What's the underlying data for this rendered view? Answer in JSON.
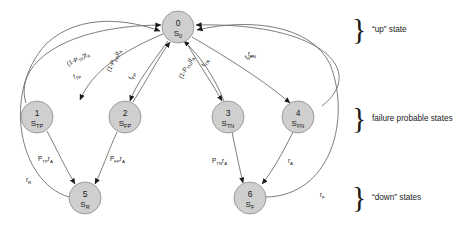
{
  "diagram": {
    "colors": {
      "node_fill": "#cfcfcf",
      "node_stroke": "#8a8a8a",
      "edge": "#6e6e6e",
      "arrow": "#1a1a1a",
      "text": "#1a1a1a",
      "background": "#ffffff"
    },
    "nodes": [
      {
        "id": "0",
        "number": "0",
        "symbol": "S",
        "subscript": "0",
        "x": 178,
        "y": 27,
        "r": 16
      },
      {
        "id": "1",
        "number": "1",
        "symbol": "S",
        "subscript": "TP",
        "x": 37,
        "y": 117,
        "r": 16
      },
      {
        "id": "2",
        "number": "2",
        "symbol": "S",
        "subscript": "FP",
        "x": 125,
        "y": 117,
        "r": 16
      },
      {
        "id": "3",
        "number": "3",
        "symbol": "S",
        "subscript": "TN",
        "x": 228,
        "y": 117,
        "r": 16
      },
      {
        "id": "4",
        "number": "4",
        "symbol": "S",
        "subscript": "FN",
        "x": 298,
        "y": 117,
        "r": 16
      },
      {
        "id": "5",
        "number": "5",
        "symbol": "S",
        "subscript": "R",
        "x": 85,
        "y": 198,
        "r": 16
      },
      {
        "id": "6",
        "number": "6",
        "symbol": "S",
        "subscript": "F",
        "x": 250,
        "y": 198,
        "r": 16
      }
    ],
    "edge_labels": [
      {
        "id": "e0_1_fwd",
        "base": "(1-P",
        "sub1": "TP",
        "mid": ")f",
        "sub2": "A",
        "x": 68,
        "y": 66,
        "rotate": -26
      },
      {
        "id": "e1_0_ret",
        "base": "f",
        "sub1": "TP",
        "mid": "",
        "sub2": "",
        "x": 74,
        "y": 79,
        "rotate": -18
      },
      {
        "id": "e0_2_fwd",
        "base": "(1-P",
        "sub1": "FP",
        "mid": ")f",
        "sub2": "A",
        "x": 110,
        "y": 72,
        "rotate": -62
      },
      {
        "id": "e2_0_ret",
        "base": "f",
        "sub1": "FP",
        "mid": "",
        "sub2": "",
        "x": 132,
        "y": 80,
        "rotate": -62
      },
      {
        "id": "e0_3_fwd",
        "base": "(1-P",
        "sub1": "TN",
        "mid": ")f",
        "sub2": "A",
        "x": 182,
        "y": 79,
        "rotate": -60
      },
      {
        "id": "e3_0_ret",
        "base": "f",
        "sub1": "TN",
        "mid": "",
        "sub2": "",
        "x": 205,
        "y": 67,
        "rotate": -62
      },
      {
        "id": "e0_4_fwd",
        "base": "f",
        "sub1": "FN",
        "mid": "",
        "sub2": "",
        "x": 247,
        "y": 60,
        "rotate": -38
      },
      {
        "id": "e6_0_ret",
        "base": "r",
        "sub1": "FN",
        "mid": "",
        "sub2": "",
        "x": 248,
        "y": 56,
        "rotate": 0
      },
      {
        "id": "e1_5",
        "base": "P",
        "sub1": "TP",
        "mid": "r",
        "sub2": "A",
        "x": 38,
        "y": 161,
        "rotate": 0
      },
      {
        "id": "e2_5",
        "base": "P",
        "sub1": "FP",
        "mid": "r",
        "sub2": "A",
        "x": 110,
        "y": 161,
        "rotate": 0
      },
      {
        "id": "e3_6",
        "base": "P",
        "sub1": "TN",
        "mid": "r",
        "sub2": "A",
        "x": 212,
        "y": 163,
        "rotate": 0
      },
      {
        "id": "e4_6",
        "base": "r",
        "sub1": "A",
        "mid": "",
        "sub2": "",
        "x": 288,
        "y": 163,
        "rotate": 0
      },
      {
        "id": "e5_0",
        "base": "r",
        "sub1": "R",
        "mid": "",
        "sub2": "",
        "x": 26,
        "y": 182,
        "rotate": 0
      },
      {
        "id": "e6_0",
        "base": "r",
        "sub1": "F",
        "mid": "",
        "sub2": "",
        "x": 320,
        "y": 197,
        "rotate": 0
      }
    ],
    "braces": [
      {
        "id": "brace-up",
        "label": "“up” state",
        "x": 352,
        "y": 28,
        "label_x": 372,
        "label_y": 32
      },
      {
        "id": "brace-failure",
        "label": "failure probable states",
        "x": 352,
        "y": 117,
        "label_x": 372,
        "label_y": 121
      },
      {
        "id": "brace-down",
        "label": "“down” states",
        "x": 352,
        "y": 196,
        "label_x": 372,
        "label_y": 200
      }
    ]
  }
}
